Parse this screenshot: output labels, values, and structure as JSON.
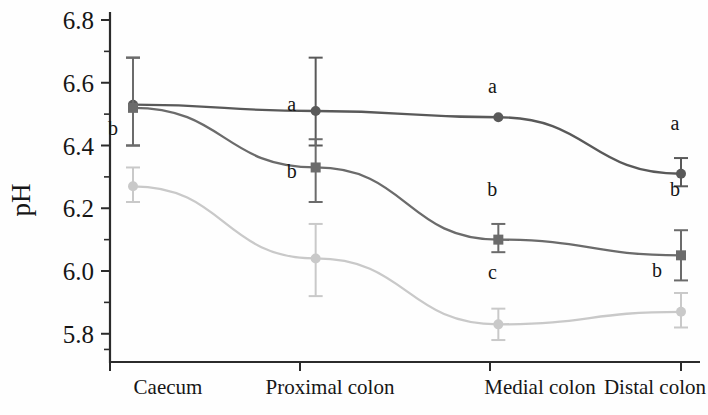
{
  "chart_data": {
    "type": "line",
    "title": "",
    "xlabel": "",
    "ylabel": "pH",
    "categories": [
      "Caecum",
      "Proximal colon",
      "Medial colon",
      "Distal colon"
    ],
    "ylim": [
      5.71,
      6.8
    ],
    "y_ticks": [
      "6.8",
      "6.6",
      "6.4",
      "6.2",
      "6.0",
      "5.8"
    ],
    "y_tick_values": [
      6.8,
      6.6,
      6.4,
      6.2,
      6.0,
      5.8
    ],
    "y_minor_ticks": [
      6.7,
      6.5,
      6.3,
      6.1,
      5.9
    ],
    "grid": false,
    "legend": "none",
    "error_bars": "present",
    "series": [
      {
        "name": "series-1",
        "color": "#595959",
        "marker": "circle",
        "values": [
          6.53,
          6.51,
          6.49,
          6.31
        ],
        "err_low": [
          6.4,
          6.4,
          6.49,
          6.27
        ],
        "err_high": [
          6.68,
          6.68,
          6.49,
          6.36
        ],
        "letters": [
          "a",
          "a",
          "a",
          "a"
        ]
      },
      {
        "name": "series-2",
        "color": "#6b6b6b",
        "marker": "square",
        "values": [
          6.52,
          6.33,
          6.1,
          6.05
        ],
        "err_low": [
          6.4,
          6.22,
          6.06,
          5.97
        ],
        "err_high": [
          6.68,
          6.42,
          6.15,
          6.13
        ],
        "letters": [
          "a",
          "a",
          "b",
          "b"
        ]
      },
      {
        "name": "series-3",
        "color": "#c9c9c9",
        "marker": "circle",
        "values": [
          6.27,
          6.04,
          5.83,
          5.87
        ],
        "err_low": [
          6.22,
          5.92,
          5.78,
          5.82
        ],
        "err_high": [
          6.33,
          6.15,
          5.88,
          5.93
        ],
        "letters": [
          "b",
          "b",
          "c",
          "b"
        ]
      }
    ],
    "annotations": [
      {
        "text": "a",
        "series": "series-1",
        "category": "Caecum"
      },
      {
        "text": "b",
        "series": "series-3",
        "category": "Caecum"
      },
      {
        "text": "a",
        "series": "series-1",
        "category": "Proximal colon"
      },
      {
        "text": "a",
        "series": "series-2",
        "category": "Proximal colon"
      },
      {
        "text": "b",
        "series": "series-3",
        "category": "Proximal colon"
      },
      {
        "text": "a",
        "series": "series-1",
        "category": "Medial colon"
      },
      {
        "text": "b",
        "series": "series-2",
        "category": "Medial colon"
      },
      {
        "text": "c",
        "series": "series-3",
        "category": "Medial colon"
      },
      {
        "text": "a",
        "series": "series-1",
        "category": "Distal colon"
      },
      {
        "text": "b",
        "series": "series-2",
        "category": "Distal colon"
      },
      {
        "text": "b",
        "series": "series-3",
        "category": "Distal colon"
      }
    ]
  },
  "axis": {
    "y_title": "pH",
    "y_labels": [
      "6.8",
      "6.6",
      "6.4",
      "6.2",
      "6.0",
      "5.8"
    ],
    "x_labels": [
      "Caecum",
      "Proximal colon",
      "Medial colon",
      "Distal colon"
    ]
  }
}
